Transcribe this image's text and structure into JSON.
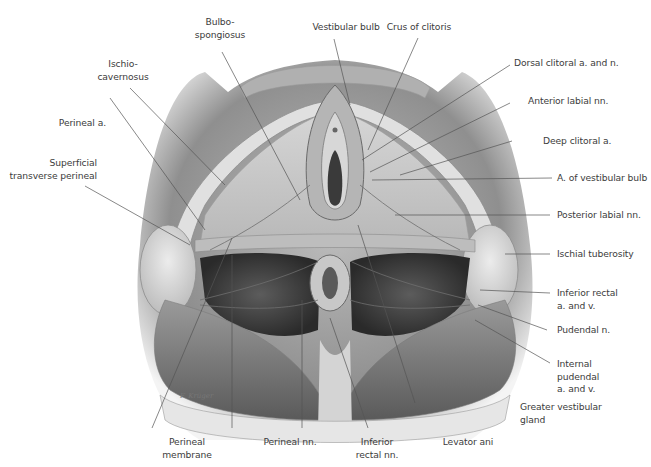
{
  "figure": {
    "palette": {
      "background": "#ffffff",
      "skin_shadow": "#8a8a8a",
      "tissue_light": "#d9d9d9",
      "tissue_mid": "#a8a8a8",
      "tissue_dark": "#4a4a4a",
      "leader_line": "#555555",
      "label_text": "#3c3c3c"
    },
    "signature": "F. Krüger"
  },
  "labels": {
    "top": {
      "bulbospongiosus": [
        "Bulbo-",
        "spongiosus"
      ],
      "vestibular_bulb": "Vestibular bulb",
      "crus_of_clitoris": "Crus of clitoris"
    },
    "left": {
      "ischiocavernosus": [
        "Ischio-",
        "cavernosus"
      ],
      "perineal_a": "Perineal a.",
      "superficial_transverse_perineal": [
        "Superficial",
        "transverse perineal"
      ]
    },
    "right": {
      "dorsal_clitoral": "Dorsal clitoral a. and n.",
      "anterior_labial": "Anterior labial nn.",
      "deep_clitoral": "Deep clitoral a.",
      "a_vestibular_bulb": "A. of vestibular bulb",
      "posterior_labial": "Posterior labial nn.",
      "ischial_tuberosity": "Ischial tuberosity",
      "inferior_rectal_av": [
        "Inferior rectal",
        "a. and v."
      ],
      "pudendal_n": "Pudendal n.",
      "internal_pudendal": [
        "Internal",
        "pudendal",
        "a. and v."
      ],
      "greater_vestibular_gland": [
        "Greater vestibular",
        "gland"
      ]
    },
    "bottom": {
      "perineal_membrane": [
        "Perineal",
        "membrane"
      ],
      "perineal_nn": "Perineal nn.",
      "inferior_rectal_nn": [
        "Inferior",
        "rectal nn."
      ],
      "levator_ani": "Levator ani"
    }
  }
}
